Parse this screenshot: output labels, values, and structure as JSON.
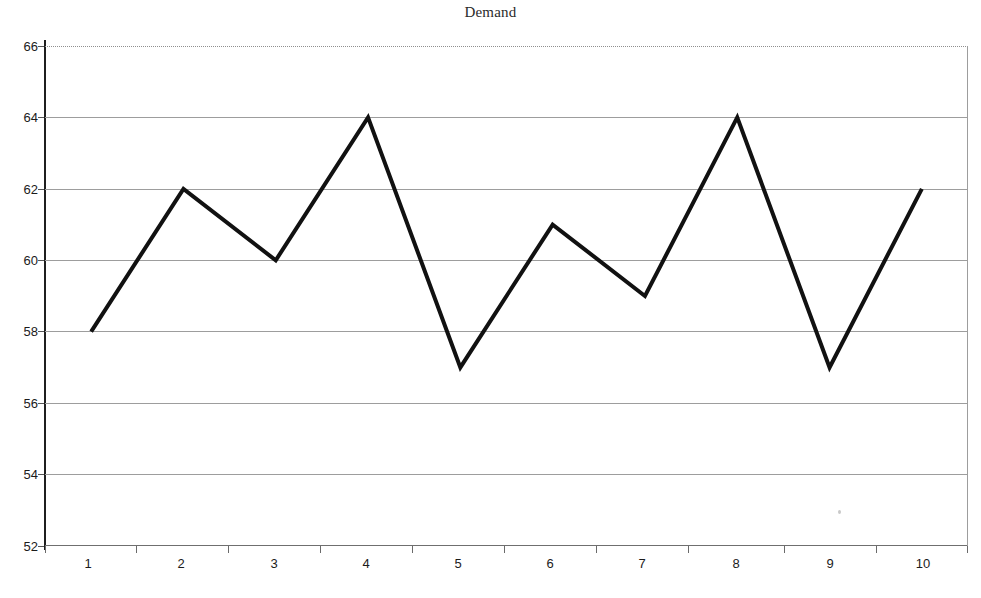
{
  "chart_data": {
    "type": "line",
    "title": "Demand",
    "xlabel": "",
    "ylabel": "",
    "categories": [
      "1",
      "2",
      "3",
      "4",
      "5",
      "6",
      "7",
      "8",
      "9",
      "10"
    ],
    "values": [
      58,
      62,
      60,
      64,
      57,
      61,
      59,
      64,
      57,
      62
    ],
    "series": [
      {
        "name": "Demand",
        "values": [
          58,
          62,
          60,
          64,
          57,
          61,
          59,
          64,
          57,
          62
        ]
      }
    ],
    "ylim": [
      52,
      66
    ],
    "yticks": [
      52,
      54,
      56,
      58,
      60,
      62,
      64,
      66
    ],
    "ytick_labels": [
      "52",
      "54",
      "56",
      "58",
      "60",
      "62",
      "64",
      "66"
    ],
    "xtick_labels": [
      "1",
      "2",
      "3",
      "4",
      "5",
      "6",
      "7",
      "8",
      "9",
      "10"
    ],
    "grid": true,
    "legend": false,
    "legend_position": "none",
    "line_color": "#111111",
    "line_width": 4,
    "markers": false,
    "gridline_color": "#9d9d9d",
    "background_color": "#ffffff",
    "axis_color": "#1f1f1f"
  },
  "labels": {
    "title": "Demand",
    "y_0": "66",
    "y_1": "64",
    "y_2": "62",
    "y_3": "60",
    "y_4": "58",
    "y_5": "56",
    "y_6": "54",
    "y_7": "52",
    "x_0": "1",
    "x_1": "2",
    "x_2": "3",
    "x_3": "4",
    "x_4": "5",
    "x_5": "6",
    "x_6": "7",
    "x_7": "8",
    "x_8": "9",
    "x_9": "10"
  }
}
